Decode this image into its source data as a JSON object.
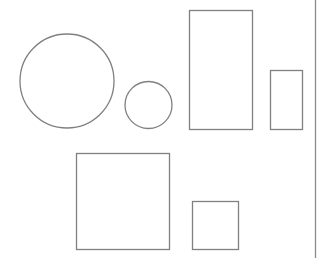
{
  "diagram": {
    "stroke_color": "#808080",
    "divider_color": "#8a8a8a",
    "background": "#ffffff",
    "shapes": [
      {
        "name": "large-circle",
        "kind": "circle"
      },
      {
        "name": "small-circle",
        "kind": "circle"
      },
      {
        "name": "tall-rectangle",
        "kind": "rect"
      },
      {
        "name": "small-rectangle",
        "kind": "rect"
      },
      {
        "name": "large-square",
        "kind": "rect"
      },
      {
        "name": "small-square",
        "kind": "rect"
      }
    ]
  }
}
